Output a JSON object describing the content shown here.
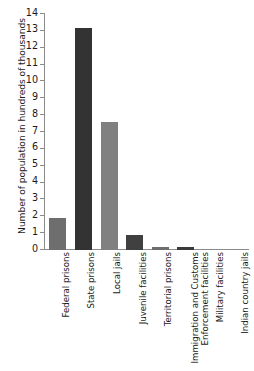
{
  "chart_data": {
    "type": "bar",
    "title": "",
    "xlabel": "",
    "ylabel": "Number of population in hundreds of thousands",
    "ylim": [
      0,
      14
    ],
    "ytick_step": 1,
    "ytick_labels": [
      "14",
      "13",
      "12",
      "11",
      "10",
      "9",
      "8",
      "7",
      "6",
      "5",
      "4",
      "3",
      "2",
      "1",
      "0"
    ],
    "grid": false,
    "legend": "none",
    "categories": [
      "Federal prisons",
      "State prisons",
      "Local jails",
      "Juvenile facilities",
      "Territorial prisons",
      "Immigration and Customs Enforcement facilities",
      "Military facilities",
      "Indian country jails"
    ],
    "category_lines": [
      [
        "Federal prisons"
      ],
      [
        "State prisons"
      ],
      [
        "Local jails"
      ],
      [
        "Juvenile facilities"
      ],
      [
        "Territorial prisons"
      ],
      [
        "Immigration and Customs",
        "Enforcement facilities"
      ],
      [
        "Military facilities"
      ],
      [
        "Indian country jails"
      ]
    ],
    "values": [
      1.9,
      13.2,
      7.6,
      0.9,
      0.2,
      0.2,
      0.07,
      0.05
    ],
    "bar_colors": [
      "#6e6e6e",
      "#333333",
      "#808080",
      "#404040",
      "#6e6e6e",
      "#3a3a3a",
      "#8a8a8a",
      "#8a8a8a"
    ],
    "axis_color": "#8c8c8c",
    "background": "#ffffff"
  }
}
